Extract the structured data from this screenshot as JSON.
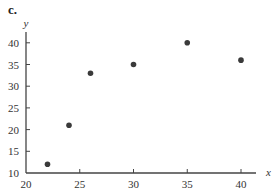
{
  "panel_label": "c.",
  "chart_data": {
    "type": "scatter",
    "title": "",
    "xlabel": "x",
    "ylabel": "y",
    "xlim": [
      20,
      42
    ],
    "ylim": [
      10,
      42
    ],
    "xticks": [
      20,
      25,
      30,
      35,
      40
    ],
    "yticks": [
      10,
      15,
      20,
      25,
      30,
      35,
      40
    ],
    "grid": false,
    "legend": null,
    "series": [
      {
        "name": "data",
        "color": "#3a3a3a",
        "points": [
          {
            "x": 22,
            "y": 12
          },
          {
            "x": 24,
            "y": 21
          },
          {
            "x": 26,
            "y": 33
          },
          {
            "x": 30,
            "y": 35
          },
          {
            "x": 35,
            "y": 40
          },
          {
            "x": 40,
            "y": 36
          }
        ]
      }
    ]
  }
}
